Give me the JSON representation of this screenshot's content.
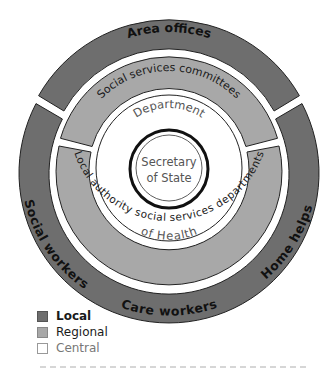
{
  "diagram": {
    "outer_ring": {
      "level": "Local",
      "color": "#6e6e6e",
      "segments": [
        {
          "label": "Area offices",
          "position": "top"
        },
        {
          "label": "Social workers",
          "position": "bottom-left"
        },
        {
          "label": "Care workers",
          "position": "bottom"
        },
        {
          "label": "Home helps",
          "position": "bottom-right"
        }
      ]
    },
    "middle_ring": {
      "level": "Regional",
      "color": "#a8a8a8",
      "segments": [
        {
          "label": "Social services committees",
          "position": "top"
        },
        {
          "label": "Local authority social services departments",
          "position": "bottom"
        }
      ]
    },
    "inner_ring": {
      "level": "Central",
      "color": "#ffffff",
      "label_top": "Department",
      "label_bottom": "of Health"
    },
    "core": {
      "level": "Central",
      "line1": "Secretary",
      "line2": "of State"
    }
  },
  "legend": {
    "items": [
      {
        "label": "Local",
        "color": "#6e6e6e"
      },
      {
        "label": "Regional",
        "color": "#a8a8a8"
      },
      {
        "label": "Central",
        "color": "#ffffff"
      }
    ]
  }
}
